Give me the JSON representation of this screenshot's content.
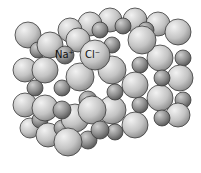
{
  "diagram": {
    "labels": {
      "sodium": "Na⁺",
      "chloride": "Cl⁻"
    },
    "colors": {
      "chloride": "#c8c8c8",
      "sodium": "#8f8f8f",
      "outline": "#3a3a3a",
      "background": "#ffffff"
    }
  }
}
